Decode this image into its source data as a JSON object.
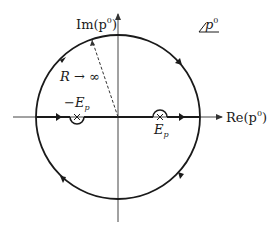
{
  "diagram": {
    "type": "complex-plane-contour",
    "labels": {
      "im_axis": "Im(p",
      "re_axis": "Re(p",
      "sup": "0",
      "plane": "p",
      "radius": "R → ∞",
      "pole_neg_minus": "−E",
      "pole_pos": "E",
      "sub": "p"
    },
    "colors": {
      "line": "#1a1a1a",
      "axis": "#333333"
    },
    "geometry": {
      "center": [
        118,
        117
      ],
      "radius": 82,
      "poles": [
        {
          "name": "-E_p",
          "x": 77,
          "y": 117,
          "detour": "below"
        },
        {
          "name": "E_p",
          "x": 160,
          "y": 117,
          "detour": "above"
        }
      ]
    }
  }
}
